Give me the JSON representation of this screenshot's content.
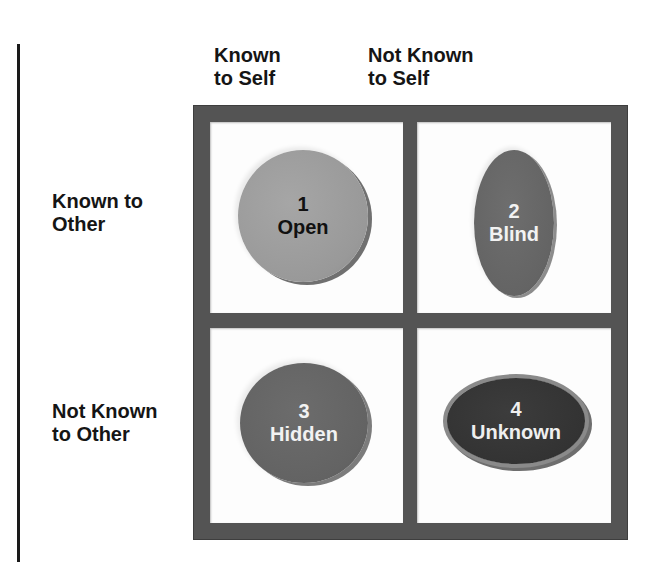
{
  "diagram": {
    "type": "johari-window",
    "column_headers": [
      {
        "line1": "Known",
        "line2": "to Self"
      },
      {
        "line1": "Not Known",
        "line2": "to Self"
      }
    ],
    "row_headers": [
      {
        "line1": "Known to",
        "line2": "Other"
      },
      {
        "line1": "Not Known",
        "line2": "to Other"
      }
    ],
    "quadrants": [
      {
        "number": "1",
        "label": "Open",
        "fill": "#999999",
        "text_color": "#111111"
      },
      {
        "number": "2",
        "label": "Blind",
        "fill": "#646464",
        "text_color": "#f2f2f2"
      },
      {
        "number": "3",
        "label": "Hidden",
        "fill": "#636363",
        "text_color": "#f2f2f2"
      },
      {
        "number": "4",
        "label": "Unknown",
        "fill": "#333333",
        "text_color": "#efefef"
      }
    ],
    "colors": {
      "frame": "#545454",
      "cell_background": "#fdfdfd",
      "rule_line": "#1a1a1a"
    }
  }
}
